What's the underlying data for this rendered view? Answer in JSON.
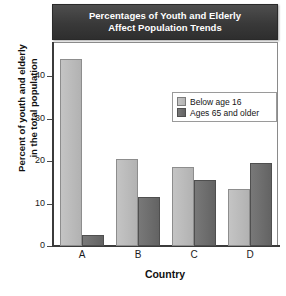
{
  "chart_data": {
    "type": "bar",
    "title": "Percentages of Youth and Elderly Affect Population Trends",
    "title_line1": "Percentages of Youth and Elderly",
    "title_line2": "Affect Population Trends",
    "xlabel": "Country",
    "ylabel": "Percent of youth and elderly in the total population",
    "ylabel_line1": "Percent of youth and elderly",
    "ylabel_line2": "in the total population",
    "categories": [
      "A",
      "B",
      "C",
      "D"
    ],
    "ylim": [
      0,
      48
    ],
    "yticks": [
      0,
      10,
      20,
      30,
      40
    ],
    "ytick_labels": [
      "0",
      "10",
      "20",
      "30",
      "40"
    ],
    "grid": false,
    "legend_position": "upper right",
    "series": [
      {
        "name": "Below age 16",
        "color": "#bdbdbd",
        "values": [
          44.0,
          20.5,
          18.5,
          13.5
        ]
      },
      {
        "name": "Ages 65 and older",
        "color": "#6e6e6e",
        "values": [
          2.5,
          11.5,
          15.5,
          19.5
        ]
      }
    ]
  },
  "style": {
    "header_background": "#3a3a3a",
    "header_text_color": "#ffffff",
    "plot_background": "#ffffff",
    "axis_color": "#3b3b3b",
    "frame_color": "#8a8a8a",
    "light_bar_color": "#bdbdbd",
    "dark_bar_color": "#6e6e6e"
  }
}
